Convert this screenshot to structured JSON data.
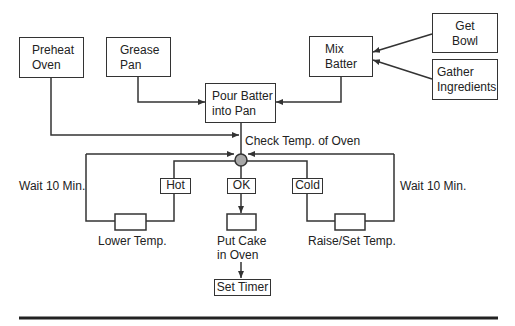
{
  "diagram": {
    "nodes": {
      "preheat_oven": {
        "line1": "Preheat",
        "line2": "Oven"
      },
      "grease_pan": {
        "line1": "Grease",
        "line2": "Pan"
      },
      "pour_batter": {
        "line1": "Pour Batter",
        "line2": "into Pan"
      },
      "mix_batter": {
        "line1": "Mix",
        "line2": "Batter"
      },
      "get_bowl": {
        "line1": "Get",
        "line2": "Bowl"
      },
      "gather_ingredients": {
        "line1": "Gather",
        "line2": "Ingredients"
      },
      "hot": {
        "label": "Hot"
      },
      "ok": {
        "label": "OK"
      },
      "cold": {
        "label": "Cold"
      },
      "set_timer": {
        "label": "Set Timer"
      }
    },
    "labels": {
      "check_temp": "Check Temp. of Oven",
      "wait_left": "Wait 10 Min.",
      "wait_right": "Wait 10 Min.",
      "lower_temp": "Lower Temp.",
      "put_cake_line1": "Put Cake",
      "put_cake_line2": "in Oven",
      "raise_temp": "Raise/Set Temp."
    },
    "edges": [
      {
        "from": "Get Bowl",
        "to": "Mix Batter"
      },
      {
        "from": "Gather Ingredients",
        "to": "Mix Batter"
      },
      {
        "from": "Mix Batter",
        "to": "Pour Batter into Pan"
      },
      {
        "from": "Grease Pan",
        "to": "Pour Batter into Pan"
      },
      {
        "from": "Preheat Oven",
        "to": "Check Temp. of Oven"
      },
      {
        "from": "Pour Batter into Pan",
        "to": "Check Temp. of Oven"
      },
      {
        "from": "Check Temp. of Oven",
        "to": "Hot"
      },
      {
        "from": "Check Temp. of Oven",
        "to": "OK"
      },
      {
        "from": "Check Temp. of Oven",
        "to": "Cold"
      },
      {
        "from": "Hot",
        "to": "Lower Temp.",
        "label": "Wait 10 Min.",
        "loops_to": "Check Temp. of Oven"
      },
      {
        "from": "Cold",
        "to": "Raise/Set Temp.",
        "label": "Wait 10 Min.",
        "loops_to": "Check Temp. of Oven"
      },
      {
        "from": "OK",
        "to": "Put Cake in Oven"
      },
      {
        "from": "Put Cake in Oven",
        "to": "Set Timer"
      }
    ],
    "colors": {
      "line": "#333333",
      "junction_fill": "#a8a8a8",
      "background": "#ffffff"
    }
  }
}
